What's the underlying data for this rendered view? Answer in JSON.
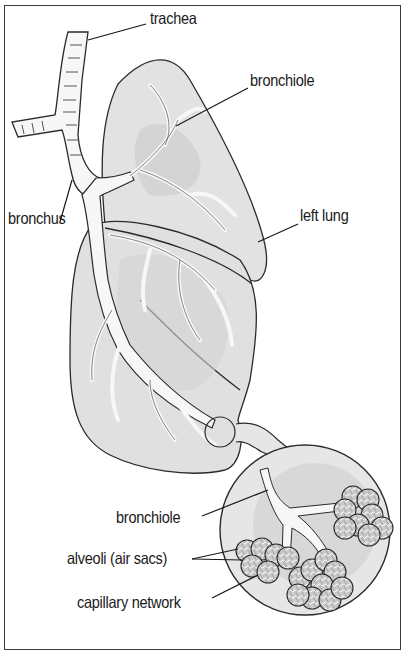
{
  "figure": {
    "colors": {
      "lung_fill": "#e2e2e2",
      "lung_shade": "#cfcfcf",
      "airway_fill": "#f7f7f7",
      "outline": "#2a2a2a",
      "inset_fill": "#e6e6e6",
      "inset_shade": "#d2d2d2",
      "alveoli_fill": "#bdbdbd",
      "background": "#ffffff",
      "frame": "#3a3a3a"
    }
  },
  "labels": {
    "trachea": "trachea",
    "bronchiole_top": "bronchiole",
    "bronchus": "bronchus",
    "left_lung": "left lung",
    "bronchiole_inset": "bronchiole",
    "alveoli": "alveoli (air sacs)",
    "capillary": "capillary network"
  }
}
